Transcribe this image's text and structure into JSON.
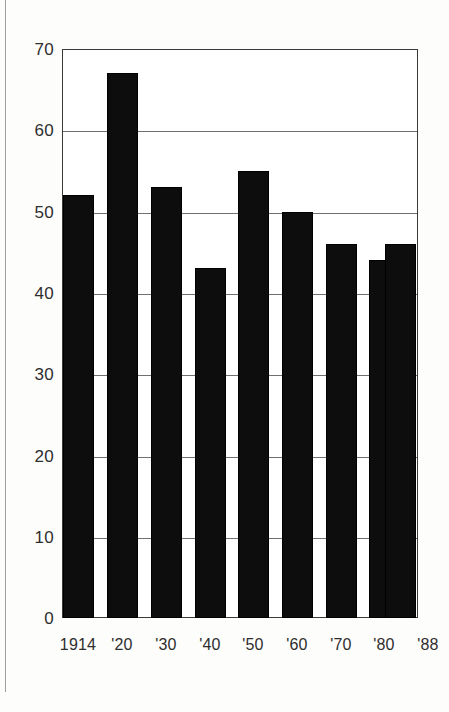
{
  "chart_data": {
    "type": "bar",
    "title": "",
    "subtitle": "",
    "xlabel": "",
    "ylabel": "",
    "categories": [
      "1914",
      "'20",
      "'30",
      "'40",
      "'50",
      "'60",
      "'70",
      "'80",
      "'88"
    ],
    "values": [
      52,
      67,
      53,
      43,
      55,
      50,
      46,
      44,
      46
    ],
    "ylim": [
      0,
      70
    ],
    "ytick_labels": [
      "0",
      "10",
      "20",
      "30",
      "40",
      "50",
      "60",
      "70"
    ],
    "ytick_values": [
      0,
      10,
      20,
      30,
      40,
      50,
      60,
      70
    ],
    "grid": true,
    "grid_axis": "y",
    "legend": "none",
    "bar_color": "#0d0d0d",
    "grid_color": "#6f6f6f",
    "frame_color": "#3a3a3a",
    "background_color": "#ffffff",
    "page_color": "#fdfdfc",
    "text_color": "#2e2e2e"
  }
}
